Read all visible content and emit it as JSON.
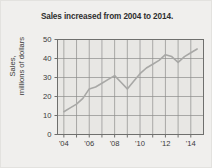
{
  "figure": {
    "title": "Sales increased from 2004 to 2014.",
    "background_color": "#f0efed",
    "plot_background_color": "#e8e7e4",
    "line_color": "#a8a8a6",
    "grid_color": "#8d8d8b",
    "axis_color": "#6f6f6d",
    "text_color": "#3a3a3a"
  },
  "axes": {
    "y_title_line1": "Sales,",
    "y_title_line2": "millions of dollars",
    "x_title": ""
  },
  "chart_data": {
    "type": "line",
    "title": "Sales increased from 2004 to 2014.",
    "xlabel": "",
    "ylabel": "Sales, millions of dollars",
    "xlim": [
      2004,
      2015.5
    ],
    "ylim": [
      0,
      50
    ],
    "grid": true,
    "legend": null,
    "ytick_labels": [
      "0",
      "10",
      "20",
      "30",
      "40",
      "50"
    ],
    "ytick_values": [
      0,
      10,
      20,
      30,
      40,
      50
    ],
    "xtick_labels": [
      "'04",
      "'06",
      "'08",
      "'10",
      "'12",
      "'14"
    ],
    "xtick_values": [
      2004,
      2006,
      2008,
      2010,
      2012,
      2014
    ],
    "x": [
      2004.5,
      2005.0,
      2005.5,
      2006.0,
      2006.5,
      2007.0,
      2007.5,
      2008.0,
      2008.5,
      2009.0,
      2009.5,
      2010.0,
      2010.5,
      2011.0,
      2011.5,
      2012.0,
      2012.5,
      2013.0,
      2013.5,
      2014.0,
      2014.5,
      2015.0
    ],
    "values": [
      12,
      14,
      16,
      19,
      24,
      25,
      27,
      29,
      31,
      27.5,
      24,
      28,
      32,
      35,
      37,
      39,
      42,
      41,
      38,
      41,
      43,
      45
    ]
  }
}
